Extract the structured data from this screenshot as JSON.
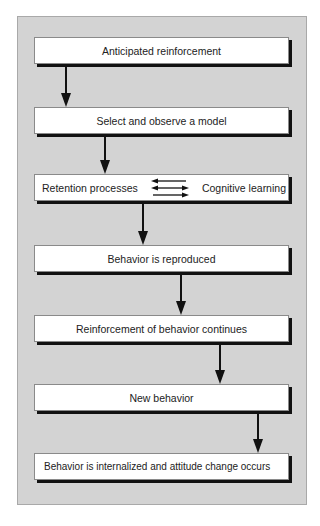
{
  "diagram": {
    "type": "flowchart",
    "direction": "top-to-bottom",
    "steps": [
      {
        "id": "box1",
        "label": "Anticipated reinforcement"
      },
      {
        "id": "box2",
        "label": "Select and observe a model"
      },
      {
        "id": "box3",
        "left_label": "Retention processes",
        "right_label": "Cognitive learning",
        "relation": "bidirectional"
      },
      {
        "id": "box4",
        "label": "Behavior is reproduced"
      },
      {
        "id": "box5",
        "label": "Reinforcement of behavior continues"
      },
      {
        "id": "box6",
        "label": "New behavior"
      },
      {
        "id": "box7",
        "label": "Behavior is internalized and attitude change occurs"
      }
    ],
    "connections": [
      {
        "from": "box1",
        "to": "box2"
      },
      {
        "from": "box2",
        "to": "box3"
      },
      {
        "from": "box3",
        "to": "box4"
      },
      {
        "from": "box4",
        "to": "box5"
      },
      {
        "from": "box5",
        "to": "box6"
      },
      {
        "from": "box6",
        "to": "box7"
      }
    ]
  },
  "colors": {
    "panel_background": "#d3d3d3",
    "box_background": "#ffffff",
    "shadow": "#111111",
    "arrow": "#111111"
  }
}
